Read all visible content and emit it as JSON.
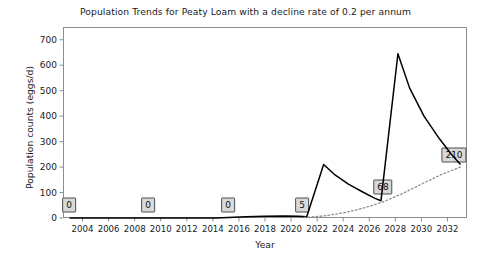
{
  "chart_data": {
    "type": "line",
    "title": "Population Trends for Peaty Loam with a decline rate of 0.2 per annum",
    "xlabel": "Year",
    "ylabel": "Population counts (eggs/d)",
    "xlim": [
      2002.5,
      2033.5
    ],
    "ylim": [
      0,
      750
    ],
    "grid": false,
    "legend": null,
    "yticks": [
      0,
      100,
      200,
      300,
      400,
      500,
      600,
      700
    ],
    "ytick_labels": [
      "0",
      "100",
      "200",
      "300",
      "400",
      "500",
      "600",
      "700"
    ],
    "xticks": [
      2004,
      2006,
      2008,
      2010,
      2012,
      2014,
      2016,
      2018,
      2020,
      2022,
      2024,
      2026,
      2028,
      2030,
      2032
    ],
    "xtick_labels": [
      "2004",
      "2006",
      "2008",
      "2010",
      "2012",
      "2014",
      "2016",
      "2018",
      "2020",
      "2022",
      "2024",
      "2026",
      "2028",
      "2030",
      "2032"
    ],
    "series": [
      {
        "name": "population",
        "style": "solid",
        "color": "#000000",
        "x": [
          2003.0,
          2009.0,
          2014.2,
          2015.2,
          2016.5,
          2018.0,
          2019.5,
          2020.6,
          2021.2,
          2022.5,
          2023.4,
          2024.4,
          2025.5,
          2026.4,
          2026.9,
          2028.2,
          2029.1,
          2030.2,
          2031.4,
          2032.3,
          2033.0
        ],
        "y": [
          0,
          0,
          0,
          2,
          5,
          7,
          8,
          7,
          5,
          210,
          168,
          133,
          102,
          78,
          68,
          645,
          510,
          400,
          310,
          250,
          210
        ]
      },
      {
        "name": "trend",
        "style": "dotted",
        "color": "#8c8c8c",
        "x": [
          2021.0,
          2022.5,
          2024.0,
          2025.5,
          2027.0,
          2028.5,
          2030.0,
          2031.5,
          2033.0
        ],
        "y": [
          2,
          8,
          20,
          38,
          62,
          95,
          133,
          170,
          200
        ]
      }
    ],
    "annotations": [
      {
        "label": "0",
        "x": 2003.0,
        "y": 0,
        "px": 69,
        "py": 205
      },
      {
        "label": "0",
        "x": 2009.0,
        "y": 0,
        "px": 148,
        "py": 205
      },
      {
        "label": "0",
        "x": 2015.0,
        "y": 0,
        "px": 228,
        "py": 205
      },
      {
        "label": "5",
        "x": 2021.2,
        "y": 5,
        "px": 302,
        "py": 205
      },
      {
        "label": "68",
        "x": 2026.9,
        "y": 68,
        "px": 383,
        "py": 187
      },
      {
        "label": "210",
        "x": 2033.0,
        "y": 210,
        "px": 454,
        "py": 155
      }
    ]
  }
}
